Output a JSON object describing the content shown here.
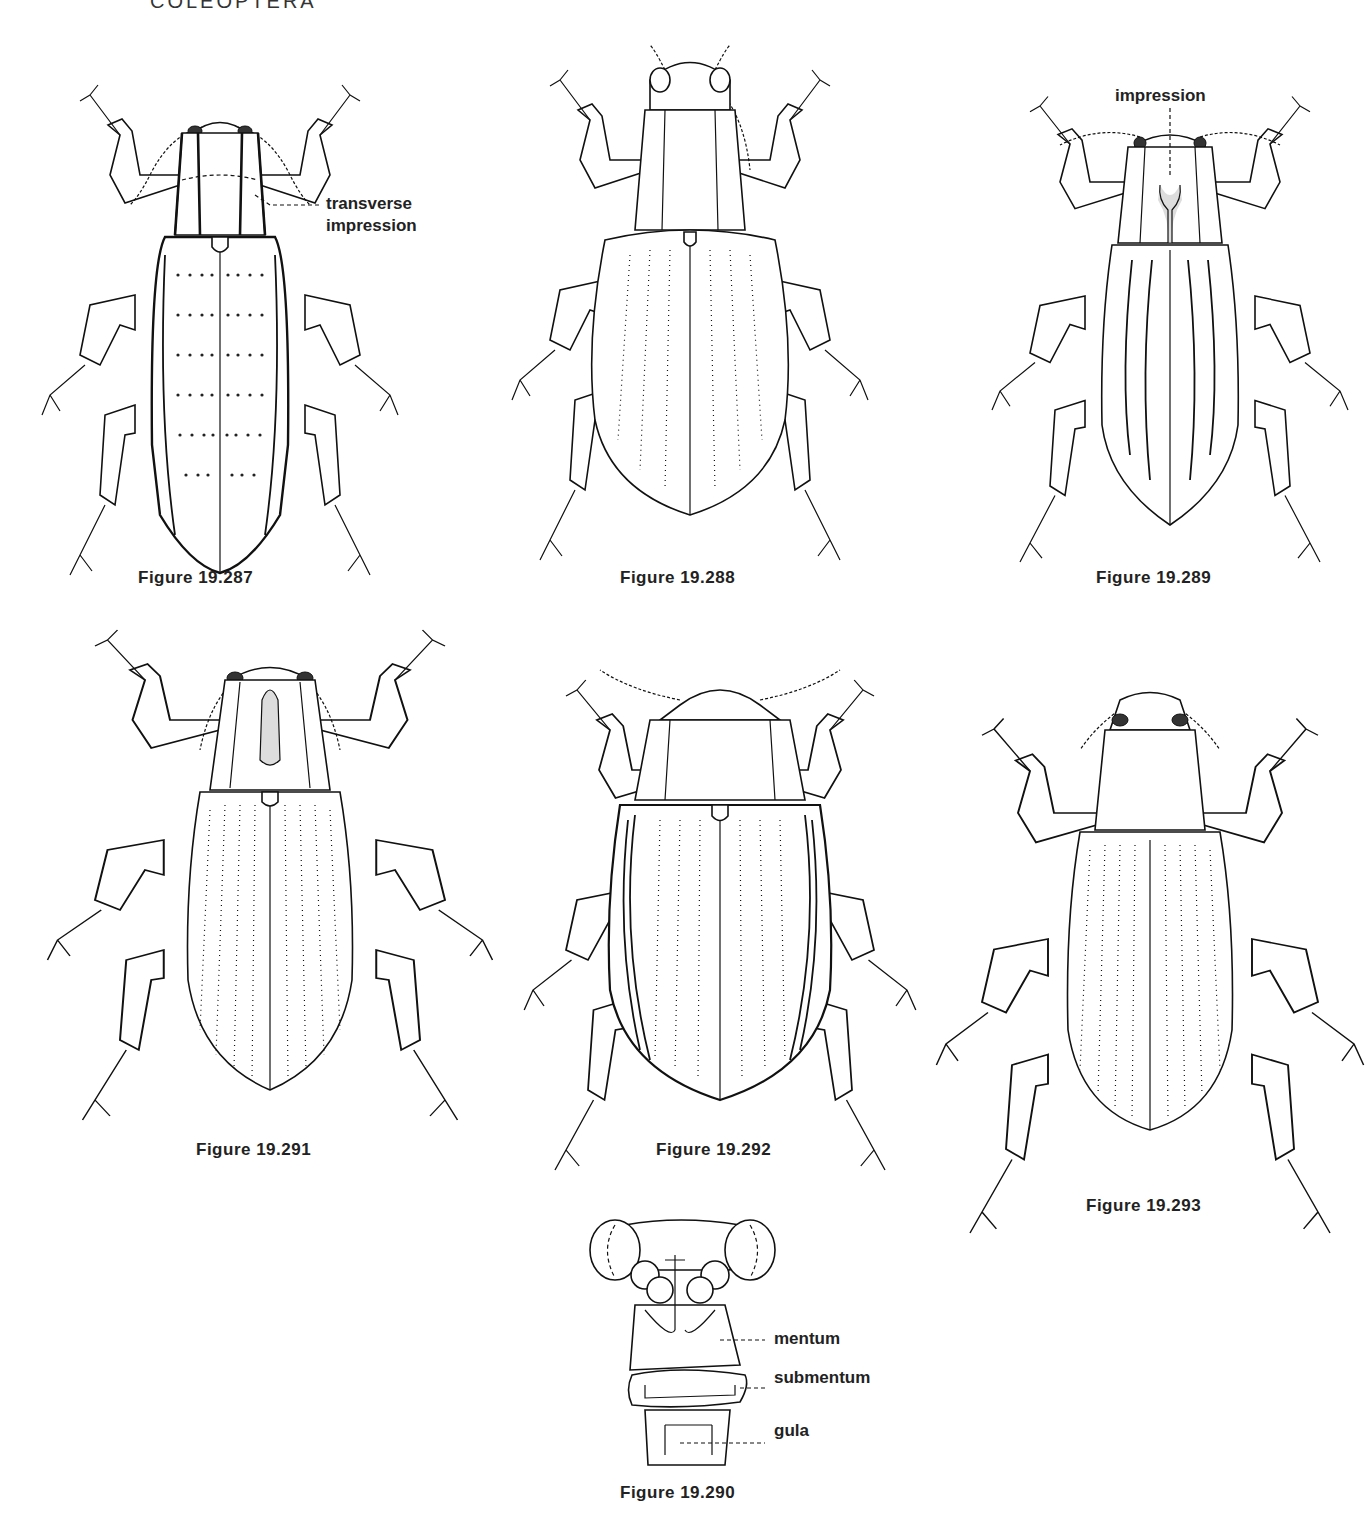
{
  "page": {
    "running_head": "COLEOPTERA"
  },
  "figures": [
    {
      "id": "fig-287",
      "caption": "Figure 19.287",
      "annotations": [
        {
          "text_line1": "transverse",
          "text_line2": "impression"
        }
      ]
    },
    {
      "id": "fig-288",
      "caption": "Figure 19.288",
      "annotations": []
    },
    {
      "id": "fig-289",
      "caption": "Figure 19.289",
      "annotations": [
        {
          "text": "impression"
        }
      ]
    },
    {
      "id": "fig-291",
      "caption": "Figure 19.291",
      "annotations": []
    },
    {
      "id": "fig-292",
      "caption": "Figure 19.292",
      "annotations": []
    },
    {
      "id": "fig-293",
      "caption": "Figure 19.293",
      "annotations": []
    },
    {
      "id": "fig-290",
      "caption": "Figure 19.290",
      "annotations": [
        {
          "text": "mentum"
        },
        {
          "text": "submentum"
        },
        {
          "text": "gula"
        }
      ]
    }
  ]
}
